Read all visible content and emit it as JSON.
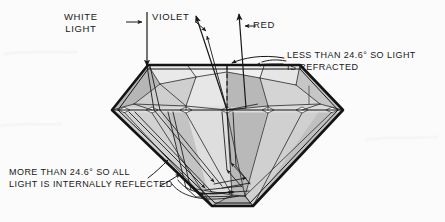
{
  "figure": {
    "background_color": "#fbfbfb",
    "ink_color": "#181818"
  },
  "labels": {
    "white_light": "WHITE\nLIGHT",
    "violet": "VIOLET",
    "red": "RED",
    "refracted_note": "LESS THAN 24.6° SO LIGHT\nIS REFRACTED",
    "reflected_note": "MORE THAN 24.6° SO ALL\nLIGHT IS INTERNALLY REFLECTED"
  },
  "physics": {
    "critical_angle": "24.6°",
    "refracted_condition": "LESS THAN 24.6°",
    "reflected_condition": "MORE THAN 24.6°",
    "incident_beam": "WHITE LIGHT",
    "dispersed_rays": [
      "VIOLET",
      "RED"
    ]
  },
  "icons": {
    "incident_arrow": "down-arrow-icon",
    "violet_ray_arrow": "up-right-arrow-icon",
    "red_ray_arrow": "up-arrow-icon",
    "pointer_white_light": "right-arrow-icon",
    "pointer_red": "left-arrow-icon",
    "leader_refracted": "curved-leader-arrow-icon",
    "leader_reflected": "curved-leader-arrow-icon"
  },
  "palette": {
    "facet_light": "#e4e4e4",
    "facet_mid": "#cfcfcf",
    "facet_dark": "#b4b4b4",
    "facet_darker": "#a2a2a2",
    "facet_pale": "#ededed",
    "outline": "#141414"
  },
  "geometry": {
    "table_left_x": 148,
    "table_right_x": 300,
    "table_y": 65,
    "girdle_y": 110,
    "girdle_left_x": 112,
    "girdle_right_x": 343,
    "culet_y": 206,
    "culet_left_x": 212,
    "culet_right_x": 253,
    "normal_line_x": 227
  }
}
